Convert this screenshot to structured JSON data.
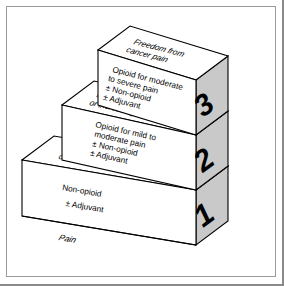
{
  "diagram": {
    "type": "3d-step-ladder",
    "colors": {
      "side_face": "#c9c9c9",
      "top_face": "#ffffff",
      "front_face": "#ffffff",
      "outline": "#000000",
      "frame_border": "#9a9a9a",
      "background": "#ffffff"
    },
    "baseline_label": "Pain",
    "steps": [
      {
        "number": "1",
        "top_label_line1": "Pain persisting",
        "top_label_line2": "or increasing",
        "front_lines": [
          "Non-opioid",
          "± Adjuvant"
        ]
      },
      {
        "number": "2",
        "top_label_line1": "Pain persisting",
        "top_label_line2": "or increasing",
        "front_lines": [
          "Opioid for mild to",
          "moderate pain",
          "± Non-opioid",
          "± Adjuvant"
        ]
      },
      {
        "number": "3",
        "top_label_line1": "Freedom from",
        "top_label_line2": "cancer pain",
        "front_lines": [
          "Opioid for moderate",
          "to severe pain",
          "± Non-opioid",
          "± Adjuvant"
        ]
      }
    ]
  }
}
